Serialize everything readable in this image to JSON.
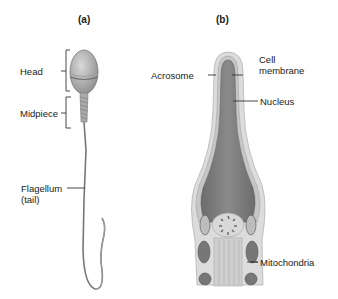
{
  "panels": {
    "a": {
      "label": "(a)"
    },
    "b": {
      "label": "(b)"
    }
  },
  "labels_a": {
    "head": "Head",
    "midpiece": "Midpiece",
    "flagellum_line1": "Flagellum",
    "flagellum_line2": "(tail)"
  },
  "labels_b": {
    "acrosome": "Acrosome",
    "cell_membrane_line1": "Cell",
    "cell_membrane_line2": "membrane",
    "nucleus": "Nucleus",
    "mitochondria": "Mitochondria"
  },
  "colors": {
    "background": "#ffffff",
    "head_fill": "#b5b5b5",
    "nucleus_fill": "#7d7d7d",
    "membrane": "#d6d6d6",
    "line": "#333333"
  }
}
